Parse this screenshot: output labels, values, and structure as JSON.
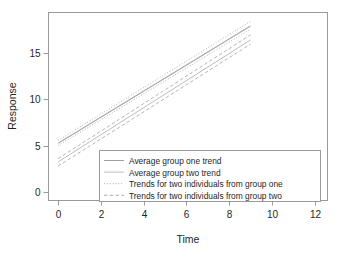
{
  "chart_data": {
    "type": "line",
    "title": "",
    "xlabel": "Time",
    "ylabel": "Response",
    "xlim": [
      -0.45,
      12.6
    ],
    "ylim": [
      -0.9,
      19.3
    ],
    "xticks": [
      0,
      2,
      4,
      6,
      8,
      10,
      12
    ],
    "yticks": [
      0,
      5,
      10,
      15
    ],
    "xtick_labels": [
      "0",
      "2",
      "4",
      "6",
      "8",
      "10",
      "12"
    ],
    "ytick_labels": [
      "0",
      "5",
      "10",
      "15"
    ],
    "grid": false,
    "legend_position": "bottom-center-right",
    "x": [
      0,
      9
    ],
    "series": [
      {
        "name": "Average group one trend",
        "style": "solid",
        "color": "#a8a8a8",
        "width": 1.1,
        "values": [
          5.25,
          17.85
        ]
      },
      {
        "name": "Average group two trend",
        "style": "solid",
        "color": "#bdbdbd",
        "width": 1.0,
        "values": [
          3.25,
          16.35
        ]
      },
      {
        "name": "Trends for two individuals from group one",
        "style": "dotted",
        "color": "#b0b0b0",
        "width": 1.0,
        "values": [
          5.55,
          18.35
        ]
      },
      {
        "name": "Trends for two individuals from group one",
        "style": "dotted",
        "color": "#b0b0b0",
        "width": 1.0,
        "values": [
          5.0,
          17.5
        ]
      },
      {
        "name": "Trends for two individuals from group two",
        "style": "dashed",
        "color": "#b5b5b5",
        "width": 1.0,
        "values": [
          3.6,
          16.9
        ]
      },
      {
        "name": "Trends for two individuals from group two",
        "style": "dashed",
        "color": "#b5b5b5",
        "width": 1.0,
        "values": [
          2.8,
          15.9
        ]
      }
    ],
    "legend": [
      {
        "label": "Average group one trend",
        "style": "solid",
        "color": "#a0a0a0"
      },
      {
        "label": "Average group two trend",
        "style": "solid",
        "color": "#c0c0c0"
      },
      {
        "label": "Trends for two individuals from group one",
        "style": "dotted",
        "color": "#ababab"
      },
      {
        "label": "Trends for two individuals from group two",
        "style": "dashed",
        "color": "#ababab"
      }
    ]
  },
  "colors": {
    "background": "#ffffff",
    "frame": "#9a9a9a",
    "text": "#1f1f1f"
  }
}
